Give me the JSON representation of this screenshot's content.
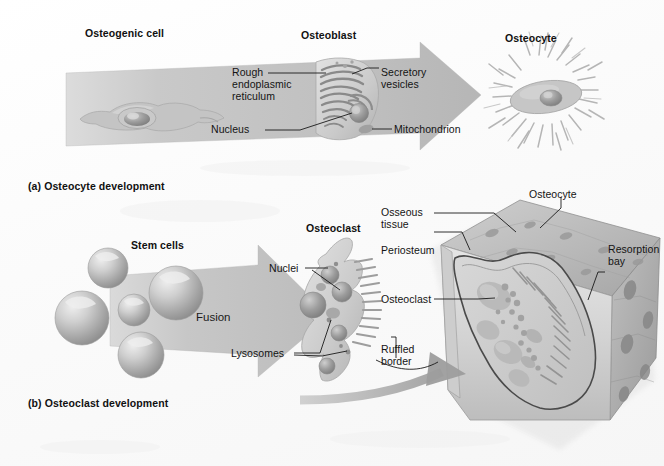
{
  "figure": {
    "background_color": "#fbfbfb",
    "arrow_color": "#c9c9c9",
    "cell_color": "#bdbdbd",
    "label_color": "#111111"
  },
  "panel_a": {
    "caption": "(a) Osteocyte development",
    "headings": {
      "start": "Osteogenic cell",
      "middle": "Osteoblast",
      "end": "Osteocyte"
    },
    "annotations": [
      {
        "name": "rough-endoplasmic-reticulum",
        "text": "Rough\nendoplasmic\nreticulum"
      },
      {
        "name": "secretory-vesicles",
        "text": "Secretory\nvesicles"
      },
      {
        "name": "nucleus",
        "text": "Nucleus"
      },
      {
        "name": "mitochondrion",
        "text": "Mitochondrion"
      }
    ]
  },
  "panel_b": {
    "caption": "(b) Osteoclast development",
    "headings": {
      "start": "Stem cells",
      "end": "Osteoclast"
    },
    "process_label": "Fusion",
    "annotations": [
      {
        "name": "nuclei",
        "text": "Nuclei"
      },
      {
        "name": "lysosomes",
        "text": "Lysosomes"
      }
    ]
  },
  "bone_detail": {
    "annotations": [
      {
        "name": "osseous-tissue",
        "text": "Osseous\ntissue"
      },
      {
        "name": "periosteum",
        "text": "Periosteum"
      },
      {
        "name": "osteoclast",
        "text": "Osteoclast"
      },
      {
        "name": "ruffled-border",
        "text": "Ruffled\nborder"
      },
      {
        "name": "osteocyte",
        "text": "Osteocyte"
      },
      {
        "name": "resorption-bay",
        "text": "Resorption\nbay"
      }
    ]
  }
}
